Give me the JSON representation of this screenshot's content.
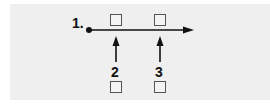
{
  "diagram": {
    "labels": {
      "origin": "1.",
      "arrow_a": "2",
      "arrow_b": "3"
    },
    "colors": {
      "panel": "#efefef",
      "ink": "#111111",
      "box_border": "#555555"
    }
  }
}
